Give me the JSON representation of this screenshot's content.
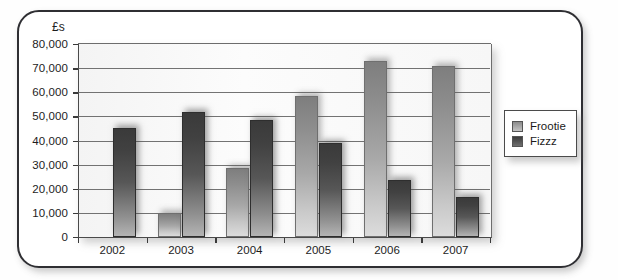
{
  "chart_data": {
    "type": "bar",
    "title": "",
    "xlabel": "",
    "ylabel": "£s",
    "categories": [
      "2002",
      "2003",
      "2004",
      "2005",
      "2006",
      "2007"
    ],
    "series": [
      {
        "name": "Frootie",
        "color": "#a8a8a8",
        "values": [
          0,
          10000,
          28500,
          58500,
          73000,
          71000
        ]
      },
      {
        "name": "Fizzz",
        "color": "#4a4a4a",
        "values": [
          45000,
          52000,
          48500,
          39000,
          23500,
          16500
        ]
      }
    ],
    "ylim": [
      0,
      80000
    ],
    "ytick_labels": [
      "80,000",
      "70,000",
      "60,000",
      "50,000",
      "40,000",
      "30,000",
      "20,000",
      "10,000",
      "0"
    ],
    "ytick_values": [
      80000,
      70000,
      60000,
      50000,
      40000,
      30000,
      20000,
      10000,
      0
    ],
    "grid": true,
    "legend_position": "right"
  },
  "legend": {
    "entries": [
      {
        "label": "Frootie"
      },
      {
        "label": "Fizzz"
      }
    ]
  }
}
